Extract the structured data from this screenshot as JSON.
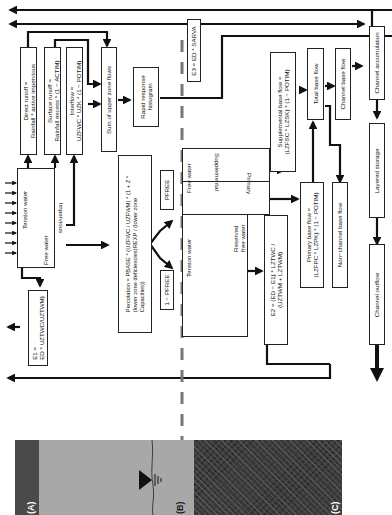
{
  "boxes": {
    "direct_runoff": "Direct runoff =\nRainfall * active impervious",
    "surface_runoff": "Surface runoff =\nRainfall excess * (1 − ACTIM)",
    "interflow": "Interflow =\nUZFWC * UZK * (1 − POTIM)",
    "sum_upper": "Sum of upper zone flows",
    "impervious": "Impervious",
    "tension_water_upper": "Tension water",
    "free_water_upper": "Free water",
    "e1": "E1 =\nED * UZTWC/UZTWM)",
    "percolation": "Percolation = PBASE * (UZFWC / UZFWM) * (1 + Z *\n(lower zone deficiencies)REXP / (lower zone\nCapacities))",
    "pfree": "PFREE",
    "one_minus_pfree": "1 − PFREE",
    "rapid_response": "Rapid response\nhistogram",
    "e3": "E3 = ED * SARVA",
    "free_water_lower": "Free water",
    "supplemental": "Supplemental",
    "primary": "Primary",
    "tension_water_lower": "Tension water",
    "reserved_free_water": "Reserved\nfree water",
    "e2": "E2 = (ED − E1) * LZTWC /\n(UZTWM + LZTWM)",
    "supplemental_base_flow": "Supplemental base flow =\n(LZFSC * LZSK) * (1 − POTIM)",
    "primary_base_flow": "Primary base flow =\n(LZFPC * LZPK) * (1 − POTIM)",
    "total_base_flow": "Total base flow",
    "non_channel_base_flow": "Non−channel base flow",
    "channel_base_flow": "Channel base flow",
    "channel_accumulation": "Channel accumulation",
    "layered_storage": "Layered storage",
    "channel_outflow": "Channel outflow"
  },
  "panels": {
    "a": "(A)",
    "b": "(B)",
    "c": "(C)"
  },
  "colors": {
    "line": "#111111",
    "dash": "#777777",
    "panel_a": "#4a4a4a",
    "panel_b": "#a8a8a8",
    "panel_c": "#3c3c3c"
  }
}
